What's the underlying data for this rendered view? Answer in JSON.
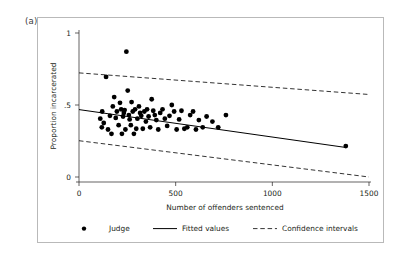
{
  "panel": {
    "label": "(a)"
  },
  "chart_data": {
    "type": "scatter",
    "title": "",
    "xlabel": "Number of offenders sentenced",
    "ylabel": "Proportion incarcerated",
    "xlim": [
      0,
      1500
    ],
    "ylim": [
      0,
      1
    ],
    "xticks": [
      0,
      500,
      1000,
      1500
    ],
    "xtick_labels": [
      "0",
      "500",
      "1000",
      "1500"
    ],
    "yticks": [
      0,
      0.5,
      1
    ],
    "ytick_labels": [
      "0",
      ".5",
      "1"
    ],
    "grid": false,
    "legend_position": "below-axes",
    "legend": [
      {
        "key": "judge",
        "label": "Judge",
        "marker": "filled-circle",
        "color": "#000000"
      },
      {
        "key": "fitted",
        "label": "Fitted values",
        "marker": "solid-line",
        "color": "#000000"
      },
      {
        "key": "ci",
        "label": "Confidence intervals",
        "marker": "dashed-line",
        "color": "#000000"
      }
    ],
    "series": [
      {
        "name": "Judge",
        "type": "scatter",
        "marker": "filled-circle",
        "color": "#000000",
        "points": [
          [
            110,
            0.405
          ],
          [
            118,
            0.345
          ],
          [
            120,
            0.455
          ],
          [
            128,
            0.375
          ],
          [
            140,
            0.695
          ],
          [
            150,
            0.33
          ],
          [
            160,
            0.425
          ],
          [
            168,
            0.3
          ],
          [
            175,
            0.49
          ],
          [
            182,
            0.555
          ],
          [
            190,
            0.41
          ],
          [
            196,
            0.455
          ],
          [
            205,
            0.36
          ],
          [
            212,
            0.515
          ],
          [
            218,
            0.47
          ],
          [
            222,
            0.3
          ],
          [
            228,
            0.42
          ],
          [
            232,
            0.445
          ],
          [
            236,
            0.465
          ],
          [
            240,
            0.33
          ],
          [
            245,
            0.87
          ],
          [
            252,
            0.6
          ],
          [
            258,
            0.43
          ],
          [
            262,
            0.4
          ],
          [
            268,
            0.36
          ],
          [
            272,
            0.52
          ],
          [
            278,
            0.455
          ],
          [
            284,
            0.3
          ],
          [
            290,
            0.47
          ],
          [
            296,
            0.335
          ],
          [
            302,
            0.405
          ],
          [
            310,
            0.49
          ],
          [
            316,
            0.445
          ],
          [
            322,
            0.425
          ],
          [
            330,
            0.335
          ],
          [
            338,
            0.455
          ],
          [
            346,
            0.385
          ],
          [
            352,
            0.47
          ],
          [
            360,
            0.42
          ],
          [
            368,
            0.345
          ],
          [
            376,
            0.54
          ],
          [
            384,
            0.46
          ],
          [
            392,
            0.43
          ],
          [
            400,
            0.395
          ],
          [
            410,
            0.33
          ],
          [
            420,
            0.445
          ],
          [
            432,
            0.47
          ],
          [
            444,
            0.405
          ],
          [
            456,
            0.355
          ],
          [
            468,
            0.425
          ],
          [
            480,
            0.5
          ],
          [
            492,
            0.455
          ],
          [
            505,
            0.33
          ],
          [
            518,
            0.4
          ],
          [
            530,
            0.46
          ],
          [
            545,
            0.335
          ],
          [
            560,
            0.345
          ],
          [
            575,
            0.43
          ],
          [
            590,
            0.455
          ],
          [
            605,
            0.33
          ],
          [
            620,
            0.395
          ],
          [
            640,
            0.345
          ],
          [
            660,
            0.42
          ],
          [
            690,
            0.385
          ],
          [
            720,
            0.345
          ],
          [
            760,
            0.43
          ],
          [
            1380,
            0.215
          ]
        ]
      },
      {
        "name": "Fitted values",
        "type": "line",
        "style": "solid",
        "color": "#000000",
        "points": [
          [
            0,
            0.468
          ],
          [
            1380,
            0.205
          ]
        ]
      },
      {
        "name": "Confidence interval upper",
        "type": "line",
        "style": "dashed",
        "color": "#000000",
        "points": [
          [
            0,
            0.723
          ],
          [
            1500,
            0.573
          ]
        ]
      },
      {
        "name": "Confidence interval lower",
        "type": "line",
        "style": "dashed",
        "color": "#000000",
        "points": [
          [
            0,
            0.252
          ],
          [
            1500,
            0.0
          ]
        ]
      }
    ]
  }
}
